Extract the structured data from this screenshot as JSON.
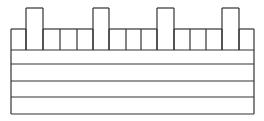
{
  "diagram": {
    "stroke": "#333333",
    "background": "#ffffff",
    "left": 11,
    "right": 254,
    "top_row": {
      "y_top": 29,
      "y_bottom": 50,
      "tall_y_top": 8
    },
    "columns": [
      11,
      26,
      43,
      60,
      77,
      93,
      109,
      126,
      141,
      157,
      174,
      190,
      206,
      222,
      239,
      254
    ],
    "tall_cells": [
      [
        26,
        43
      ],
      [
        93,
        109
      ],
      [
        157,
        174
      ],
      [
        222,
        239
      ]
    ],
    "horizontal_rows_y": [
      50,
      64,
      81,
      97,
      114
    ]
  }
}
